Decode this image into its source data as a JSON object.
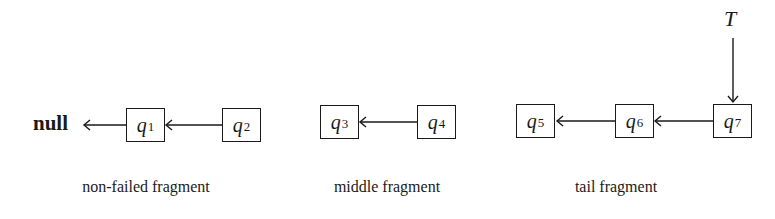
{
  "null_label": "null",
  "tail_pointer": {
    "label": "T",
    "points_to": "q7"
  },
  "fragments": [
    {
      "caption": "non-failed fragment",
      "nodes": [
        {
          "var": "q",
          "sub": "1"
        },
        {
          "var": "q",
          "sub": "2"
        }
      ]
    },
    {
      "caption": "middle fragment",
      "nodes": [
        {
          "var": "q",
          "sub": "3"
        },
        {
          "var": "q",
          "sub": "4"
        }
      ]
    },
    {
      "caption": "tail fragment",
      "nodes": [
        {
          "var": "q",
          "sub": "5"
        },
        {
          "var": "q",
          "sub": "6"
        },
        {
          "var": "q",
          "sub": "7"
        }
      ]
    }
  ],
  "edges": [
    {
      "from": "q1",
      "to": "null"
    },
    {
      "from": "q2",
      "to": "q1"
    },
    {
      "from": "q4",
      "to": "q3"
    },
    {
      "from": "q6",
      "to": "q5"
    },
    {
      "from": "q7",
      "to": "q6"
    },
    {
      "from": "T",
      "to": "q7"
    }
  ],
  "colors": {
    "stroke": "#1a1a1a",
    "background": "#ffffff"
  }
}
